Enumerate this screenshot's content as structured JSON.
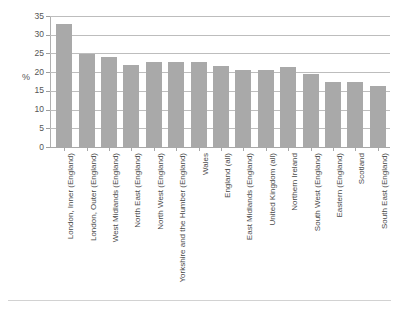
{
  "chart_data": {
    "type": "bar",
    "title": "",
    "subtitle": "",
    "xlabel": "",
    "ylabel": "%",
    "ylim": [
      0,
      35
    ],
    "ytick_step": 5,
    "yticks": [
      0,
      5,
      10,
      15,
      20,
      25,
      30,
      35
    ],
    "grid": true,
    "legend": false,
    "orientation": "vertical",
    "bar_color": "#a9a9a9",
    "categories": [
      "London, Inner (England)",
      "London, Outer (England)",
      "West Midlands (England)",
      "North East (England)",
      "North West (England)",
      "Yorkshire and the Humber (England)",
      "Wales",
      "England (all)",
      "East Midlands (England)",
      "United Kingdom (all)",
      "Northern Ireland",
      "South West (England)",
      "Eastern (England)",
      "Scotland",
      "South East (England)"
    ],
    "values": [
      33.0,
      24.8,
      24.0,
      21.8,
      22.7,
      22.7,
      22.7,
      21.6,
      20.7,
      20.6,
      21.5,
      19.5,
      17.5,
      17.5,
      16.4
    ]
  },
  "axis": {
    "y_title": "%"
  }
}
